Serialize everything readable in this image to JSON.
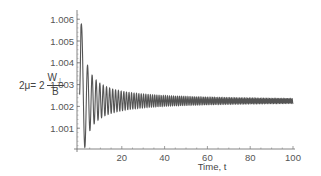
{
  "chart_data": {
    "type": "line",
    "title": "",
    "xlabel": "Time, t",
    "ylabel": "2μ = 2 W⊥ / B",
    "ylabel_parts": {
      "lhs": "2μ= 2",
      "numerator": "W",
      "numerator_sub": "⊥",
      "denominator": "B"
    },
    "xlim": [
      0,
      100
    ],
    "ylim": [
      1.0,
      1.0063
    ],
    "x_ticks": [
      20,
      40,
      60,
      80,
      100
    ],
    "x_tick_labels": [
      "20",
      "40",
      "60",
      "80",
      "100"
    ],
    "y_ticks": [
      1.001,
      1.002,
      1.003,
      1.004,
      1.005,
      1.006
    ],
    "y_tick_labels": [
      "1.001",
      "1.002",
      "1.003",
      "1.004",
      "1.005",
      "1.006"
    ],
    "grid": false,
    "legend": null,
    "series": [
      {
        "name": "2μ(t)",
        "color": "#555555",
        "description": "damped oscillation decaying toward an asymptote with increasing frequency",
        "asymptote": 1.00225,
        "key_points": [
          {
            "t": 0.3,
            "y": 1.0023
          },
          {
            "t": 2.0,
            "y": 1.0062
          },
          {
            "t": 4.7,
            "y": 1.0008
          },
          {
            "t": 7.0,
            "y": 1.0044
          },
          {
            "t": 8.5,
            "y": 1.0013
          },
          {
            "t": 10.5,
            "y": 1.0036
          },
          {
            "t": 12.0,
            "y": 1.0015
          },
          {
            "t": 20.0,
            "y": 1.0029
          },
          {
            "t": 40.0,
            "y": 1.00245
          },
          {
            "t": 60.0,
            "y": 1.00232
          },
          {
            "t": 80.0,
            "y": 1.00228
          },
          {
            "t": 100.0,
            "y": 1.00225
          }
        ],
        "model": {
          "amplitude": 0.004,
          "decay_power": 0.9,
          "t_offset": 0.9,
          "phase_coeff": 2.9,
          "phase_power": 1.38
        }
      }
    ]
  },
  "axes": {
    "plot_left_px": 79,
    "plot_right_px": 293,
    "y_at_1000_px": 150,
    "px_per_milli": 21.8,
    "x_axis_y_px": 149,
    "y_axis_x_px": 77
  }
}
